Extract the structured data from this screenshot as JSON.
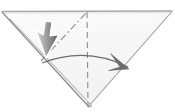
{
  "canvas": {
    "width": 175,
    "height": 112,
    "background": "#ffffff"
  },
  "figure": {
    "title": "Origami fold step diagram"
  },
  "colors": {
    "paper_fill": "#f7f7f7",
    "paper_fill_light": "#fbfbfb",
    "outline": "#9a9a9a",
    "outline_dark": "#7d7d7d",
    "top_edge": "#a8a8a8",
    "dashed_line": "#8c8c8c",
    "dashdot_line": "#8c8c8c",
    "arrow": "#6b6b6b",
    "cursor_outline": "#ffffff",
    "cursor_fill_light": "#f2f2f2",
    "cursor_fill_dark": "#4a4a4a"
  },
  "shapes": {
    "triangle": {
      "name": "paper-triangle",
      "points": "2,12 172,11 88,107",
      "note": "Large inverted triangle occupying the full frame"
    },
    "top_edge": {
      "name": "top-edge-line",
      "x1": 2,
      "y1": 12,
      "x2": 172,
      "y2": 11
    },
    "left_edge": {
      "name": "left-edge-line",
      "x1": 2,
      "y1": 12,
      "x2": 88,
      "y2": 107
    },
    "right_edge": {
      "name": "right-edge-line",
      "x1": 172,
      "y1": 11,
      "x2": 88,
      "y2": 107
    },
    "inner_layer_edge": {
      "name": "inner-layer-edge",
      "x1": 8,
      "y1": 18,
      "x2": 90,
      "y2": 106,
      "note": "Second parallel line showing the thickness of folded layers along the lower-left edge"
    },
    "center_fold": {
      "name": "center-fold-dashed-line",
      "x1": 87,
      "y1": 12,
      "x2": 88,
      "y2": 107,
      "style": "dashed",
      "dash": "6 4"
    },
    "crease_reference": {
      "name": "crease-dash-dot-line",
      "x1": 41,
      "y1": 61,
      "x2": 87,
      "y2": 12,
      "style": "dash-dot",
      "dash": "7 3 1.5 3"
    },
    "fold_arrow": {
      "name": "fold-direction-arrow",
      "path": "M 42,63 Q 86,46 128,67",
      "arrowhead": "128,68 112,54 121,68 110,71",
      "direction": "left-to-right"
    },
    "cursor": {
      "name": "mouse-cursor",
      "tip_x": 46,
      "tip_y": 58,
      "rotation_deg": 218,
      "shape": "arrow-pointer"
    }
  }
}
